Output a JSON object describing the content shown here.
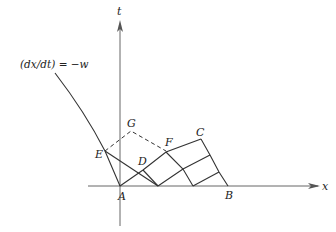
{
  "diagram": {
    "axes": {
      "x_label": "x",
      "y_label": "t"
    },
    "equation_label": "(dx/dt) = −w",
    "points": {
      "A": "A",
      "B": "B",
      "C": "C",
      "D": "D",
      "E": "E",
      "F": "F",
      "G": "G"
    },
    "colors": {
      "line": "#333333",
      "axis": "#555555",
      "background": "#ffffff"
    }
  }
}
